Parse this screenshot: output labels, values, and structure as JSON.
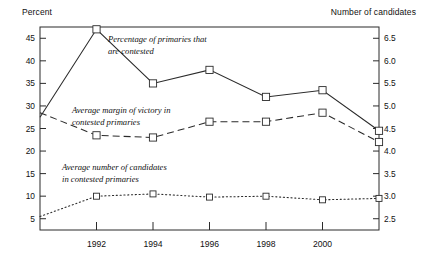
{
  "labels": {
    "left_axis_title": "Percent",
    "right_axis_title": "Number of candidates"
  },
  "chart_data": {
    "type": "line",
    "title": "",
    "xlabel": "",
    "ylabel": "Percent",
    "y2label": "Number of candidates",
    "grid": false,
    "legend": "inline-annotations",
    "x": [
      1990,
      1991,
      1992,
      1993,
      1994,
      1995,
      1996,
      1997,
      1998,
      1999,
      2000,
      2001,
      2002
    ],
    "xlim": [
      1990,
      2002
    ],
    "xticks": [
      1992,
      1994,
      1996,
      1998,
      2000
    ],
    "xticklabels": [
      "1992",
      "1994",
      "1996",
      "1998",
      "2000"
    ],
    "ylim": [
      2.5,
      47.5
    ],
    "yticks": [
      5,
      10,
      15,
      20,
      25,
      30,
      35,
      40,
      45
    ],
    "yticklabels": [
      "5",
      "10",
      "15",
      "20",
      "25",
      "30",
      "35",
      "40",
      "45"
    ],
    "y2lim": [
      2.25,
      6.75
    ],
    "y2ticks": [
      2.5,
      3.0,
      3.5,
      4.0,
      4.5,
      5.0,
      5.5,
      6.0,
      6.5
    ],
    "y2ticklabels": [
      "2.5",
      "3.0",
      "3.5",
      "4.0",
      "4.5",
      "5.0",
      "5.5",
      "6.0",
      "6.5"
    ],
    "series": [
      {
        "name": "Percentage of primaries that are contested",
        "axis": "left",
        "style": "solid",
        "markers": true,
        "annotation": [
          "Percentage of primaries that",
          "are contested"
        ],
        "x": [
          1990,
          1992,
          1994,
          1996,
          1998,
          2000,
          2002
        ],
        "values": [
          27.5,
          47.0,
          35.0,
          38.0,
          32.0,
          33.5,
          24.5
        ]
      },
      {
        "name": "Average margin of victory in contested primaries",
        "axis": "left",
        "style": "dashed",
        "markers": true,
        "annotation": [
          "Average margin of victory in",
          "contested primaries"
        ],
        "x": [
          1990,
          1992,
          1994,
          1996,
          1998,
          2000,
          2002
        ],
        "values": [
          28.5,
          23.5,
          23.0,
          26.5,
          26.5,
          28.5,
          22.0
        ]
      },
      {
        "name": "Average number of candidates in contested primaries",
        "axis": "right",
        "style": "dotted",
        "markers": true,
        "annotation": [
          "Average number of candidates",
          "in contested primaries"
        ],
        "x": [
          1990,
          1992,
          1994,
          1996,
          1998,
          2000,
          2002
        ],
        "values": [
          2.55,
          3.0,
          3.05,
          2.98,
          3.0,
          2.92,
          2.95
        ]
      }
    ]
  }
}
